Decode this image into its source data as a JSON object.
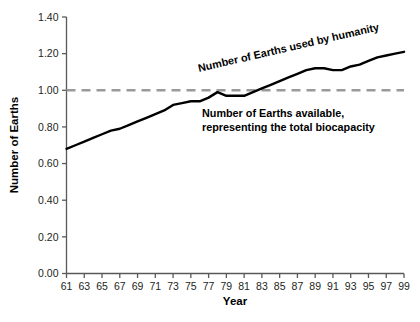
{
  "chart_data": {
    "type": "line",
    "title": "",
    "xlabel": "Year",
    "ylabel": "Number of Earths",
    "xlim": [
      61,
      99
    ],
    "ylim": [
      0.0,
      1.4
    ],
    "ytick_step": 0.2,
    "xtick_step": 2,
    "grid": false,
    "legend_position": "inline-annotations",
    "xtick_labels": [
      "61",
      "63",
      "65",
      "67",
      "69",
      "71",
      "73",
      "75",
      "77",
      "79",
      "81",
      "83",
      "85",
      "87",
      "89",
      "91",
      "93",
      "95",
      "97",
      "99"
    ],
    "ytick_labels": [
      "0.00",
      "0.20",
      "0.40",
      "0.60",
      "0.80",
      "1.00",
      "1.20",
      "1.40"
    ],
    "x": [
      61,
      62,
      63,
      64,
      65,
      66,
      67,
      68,
      69,
      70,
      71,
      72,
      73,
      74,
      75,
      76,
      77,
      78,
      79,
      80,
      81,
      82,
      83,
      84,
      85,
      86,
      87,
      88,
      89,
      90,
      91,
      92,
      93,
      94,
      95,
      96,
      97,
      98,
      99
    ],
    "series": [
      {
        "name": "Number of Earths used by humanity",
        "style": "solid",
        "color": "#000000",
        "width": 2.4,
        "values": [
          0.68,
          0.7,
          0.72,
          0.74,
          0.76,
          0.78,
          0.79,
          0.81,
          0.83,
          0.85,
          0.87,
          0.89,
          0.92,
          0.93,
          0.94,
          0.94,
          0.96,
          0.99,
          0.97,
          0.97,
          0.97,
          0.99,
          1.01,
          1.03,
          1.05,
          1.07,
          1.09,
          1.11,
          1.12,
          1.12,
          1.11,
          1.11,
          1.13,
          1.14,
          1.16,
          1.18,
          1.19,
          1.2,
          1.21
        ]
      },
      {
        "name": "Number of Earths available, representing the total biocapacity",
        "style": "dashed",
        "color": "#9a9a9a",
        "width": 2.6,
        "constant": 1.0
      }
    ],
    "annotations": [
      {
        "id": "used-by-humanity",
        "text": "Number of Earths used by humanity",
        "rotation": -13,
        "x_px": 199,
        "y_px": 72,
        "align": "left"
      },
      {
        "id": "available-biocapacity-line1",
        "text": "Number of Earths available,",
        "rotation": 0,
        "x_px": 202,
        "y_px": 117,
        "align": "left"
      },
      {
        "id": "available-biocapacity-line2",
        "text": "representing the total biocapacity",
        "rotation": 0,
        "x_px": 202,
        "y_px": 131,
        "align": "left"
      }
    ],
    "colors": {
      "line": "#000000",
      "reference_line": "#9a9a9a",
      "axis": "#58595b",
      "text": "#231f20",
      "background": "#ffffff"
    }
  }
}
